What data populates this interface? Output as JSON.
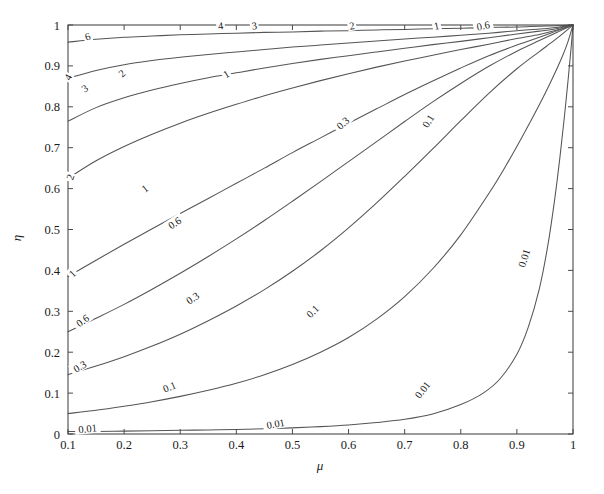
{
  "figure": {
    "kind": "contour-plot",
    "background": "#ffffff",
    "line_color": "#555555",
    "axis_color": "#4a4a4a",
    "text_color": "#1a1a1a"
  },
  "chart_data": {
    "type": "line",
    "subtype": "contour",
    "title": "",
    "xlabel": "μ",
    "ylabel": "η",
    "xlim": [
      0.1,
      1.0
    ],
    "ylim": [
      0.0,
      1.0
    ],
    "grid": false,
    "legend": "none",
    "xticks": [
      0.1,
      0.2,
      0.3,
      0.4,
      0.5,
      0.6,
      0.7,
      0.8,
      0.9,
      1.0
    ],
    "xticklabels": [
      "0.1",
      "0.2",
      "0.3",
      "0.4",
      "0.5",
      "0.6",
      "0.7",
      "0.8",
      "0.9",
      "1"
    ],
    "yticks": [
      0.0,
      0.1,
      0.2,
      0.3,
      0.4,
      0.5,
      0.6,
      0.7,
      0.8,
      0.9,
      1.0
    ],
    "yticklabels": [
      "0",
      "0.1",
      "0.2",
      "0.3",
      "0.4",
      "0.5",
      "0.6",
      "0.7",
      "0.8",
      "0.9",
      "1"
    ],
    "tick_direction": "in",
    "levels": [
      0.01,
      0.1,
      0.3,
      0.6,
      1,
      2,
      3,
      4,
      6
    ],
    "level_labels": [
      "0.01",
      "0.1",
      "0.3",
      "0.6",
      "1",
      "2",
      "3",
      "4",
      "6"
    ],
    "contours": [
      {
        "level": "0.01",
        "points": [
          [
            0.1,
            0.006
          ],
          [
            0.15,
            0.006
          ],
          [
            0.2,
            0.007
          ],
          [
            0.25,
            0.008
          ],
          [
            0.3,
            0.009
          ],
          [
            0.35,
            0.01
          ],
          [
            0.4,
            0.011
          ],
          [
            0.45,
            0.013
          ],
          [
            0.5,
            0.015
          ],
          [
            0.55,
            0.018
          ],
          [
            0.6,
            0.022
          ],
          [
            0.65,
            0.028
          ],
          [
            0.7,
            0.036
          ],
          [
            0.75,
            0.049
          ],
          [
            0.8,
            0.072
          ],
          [
            0.84,
            0.1
          ],
          [
            0.87,
            0.135
          ],
          [
            0.9,
            0.195
          ],
          [
            0.92,
            0.26
          ],
          [
            0.94,
            0.355
          ],
          [
            0.955,
            0.46
          ],
          [
            0.967,
            0.57
          ],
          [
            0.977,
            0.68
          ],
          [
            0.985,
            0.78
          ],
          [
            0.991,
            0.862
          ],
          [
            0.996,
            0.935
          ],
          [
            1.0,
            1.0
          ]
        ]
      },
      {
        "level": "0.1",
        "points": [
          [
            0.1,
            0.05
          ],
          [
            0.15,
            0.058
          ],
          [
            0.2,
            0.068
          ],
          [
            0.25,
            0.079
          ],
          [
            0.3,
            0.092
          ],
          [
            0.35,
            0.107
          ],
          [
            0.4,
            0.124
          ],
          [
            0.45,
            0.145
          ],
          [
            0.5,
            0.17
          ],
          [
            0.55,
            0.2
          ],
          [
            0.6,
            0.236
          ],
          [
            0.65,
            0.281
          ],
          [
            0.7,
            0.336
          ],
          [
            0.75,
            0.404
          ],
          [
            0.8,
            0.487
          ],
          [
            0.85,
            0.588
          ],
          [
            0.88,
            0.655
          ],
          [
            0.91,
            0.728
          ],
          [
            0.94,
            0.805
          ],
          [
            0.96,
            0.86
          ],
          [
            0.98,
            0.92
          ],
          [
            0.99,
            0.955
          ],
          [
            1.0,
            1.0
          ]
        ]
      },
      {
        "level": "0.3",
        "points": [
          [
            0.1,
            0.145
          ],
          [
            0.15,
            0.166
          ],
          [
            0.2,
            0.189
          ],
          [
            0.25,
            0.215
          ],
          [
            0.3,
            0.244
          ],
          [
            0.35,
            0.277
          ],
          [
            0.4,
            0.313
          ],
          [
            0.45,
            0.353
          ],
          [
            0.5,
            0.398
          ],
          [
            0.55,
            0.448
          ],
          [
            0.6,
            0.504
          ],
          [
            0.65,
            0.565
          ],
          [
            0.7,
            0.63
          ],
          [
            0.75,
            0.697
          ],
          [
            0.8,
            0.766
          ],
          [
            0.85,
            0.833
          ],
          [
            0.9,
            0.893
          ],
          [
            0.94,
            0.935
          ],
          [
            0.97,
            0.966
          ],
          [
            1.0,
            1.0
          ]
        ]
      },
      {
        "level": "0.6",
        "points": [
          [
            0.1,
            0.25
          ],
          [
            0.15,
            0.283
          ],
          [
            0.2,
            0.317
          ],
          [
            0.25,
            0.354
          ],
          [
            0.3,
            0.393
          ],
          [
            0.35,
            0.434
          ],
          [
            0.4,
            0.477
          ],
          [
            0.45,
            0.522
          ],
          [
            0.5,
            0.569
          ],
          [
            0.55,
            0.617
          ],
          [
            0.6,
            0.666
          ],
          [
            0.65,
            0.715
          ],
          [
            0.7,
            0.764
          ],
          [
            0.75,
            0.812
          ],
          [
            0.8,
            0.857
          ],
          [
            0.85,
            0.899
          ],
          [
            0.9,
            0.936
          ],
          [
            0.94,
            0.962
          ],
          [
            0.97,
            0.981
          ],
          [
            1.0,
            1.0
          ]
        ]
      },
      {
        "level": "1",
        "points": [
          [
            0.1,
            0.385
          ],
          [
            0.15,
            0.425
          ],
          [
            0.2,
            0.464
          ],
          [
            0.25,
            0.502
          ],
          [
            0.3,
            0.539
          ],
          [
            0.35,
            0.576
          ],
          [
            0.4,
            0.613
          ],
          [
            0.45,
            0.65
          ],
          [
            0.5,
            0.688
          ],
          [
            0.55,
            0.724
          ],
          [
            0.6,
            0.76
          ],
          [
            0.65,
            0.795
          ],
          [
            0.7,
            0.83
          ],
          [
            0.75,
            0.863
          ],
          [
            0.8,
            0.895
          ],
          [
            0.85,
            0.925
          ],
          [
            0.9,
            0.951
          ],
          [
            0.94,
            0.97
          ],
          [
            0.97,
            0.985
          ],
          [
            1.0,
            1.0
          ]
        ]
      },
      {
        "level": "2",
        "points": [
          [
            0.1,
            0.625
          ],
          [
            0.15,
            0.668
          ],
          [
            0.2,
            0.703
          ],
          [
            0.25,
            0.733
          ],
          [
            0.3,
            0.76
          ],
          [
            0.35,
            0.784
          ],
          [
            0.4,
            0.806
          ],
          [
            0.45,
            0.827
          ],
          [
            0.5,
            0.846
          ],
          [
            0.55,
            0.864
          ],
          [
            0.6,
            0.881
          ],
          [
            0.65,
            0.897
          ],
          [
            0.7,
            0.912
          ],
          [
            0.75,
            0.926
          ],
          [
            0.8,
            0.94
          ],
          [
            0.85,
            0.953
          ],
          [
            0.9,
            0.967
          ],
          [
            0.94,
            0.977
          ],
          [
            0.97,
            0.987
          ],
          [
            1.0,
            1.0
          ]
        ]
      },
      {
        "level": "3",
        "points": [
          [
            0.1,
            0.765
          ],
          [
            0.15,
            0.798
          ],
          [
            0.2,
            0.822
          ],
          [
            0.25,
            0.841
          ],
          [
            0.3,
            0.857
          ],
          [
            0.35,
            0.871
          ],
          [
            0.4,
            0.883
          ],
          [
            0.45,
            0.895
          ],
          [
            0.5,
            0.906
          ],
          [
            0.55,
            0.916
          ],
          [
            0.6,
            0.925
          ],
          [
            0.65,
            0.934
          ],
          [
            0.7,
            0.943
          ],
          [
            0.75,
            0.952
          ],
          [
            0.8,
            0.96
          ],
          [
            0.85,
            0.969
          ],
          [
            0.9,
            0.978
          ],
          [
            0.94,
            0.985
          ],
          [
            0.97,
            0.991
          ],
          [
            1.0,
            1.0
          ]
        ]
      },
      {
        "level": "4",
        "points": [
          [
            0.1,
            0.87
          ],
          [
            0.15,
            0.889
          ],
          [
            0.2,
            0.903
          ],
          [
            0.25,
            0.913
          ],
          [
            0.3,
            0.921
          ],
          [
            0.35,
            0.928
          ],
          [
            0.4,
            0.934
          ],
          [
            0.45,
            0.94
          ],
          [
            0.5,
            0.946
          ],
          [
            0.55,
            0.951
          ],
          [
            0.6,
            0.956
          ],
          [
            0.65,
            0.961
          ],
          [
            0.7,
            0.966
          ],
          [
            0.75,
            0.97
          ],
          [
            0.8,
            0.975
          ],
          [
            0.85,
            0.98
          ],
          [
            0.9,
            0.986
          ],
          [
            0.94,
            0.99
          ],
          [
            0.97,
            0.994
          ],
          [
            1.0,
            1.0
          ]
        ]
      },
      {
        "level": "6",
        "points": [
          [
            0.1,
            0.958
          ],
          [
            0.15,
            0.965
          ],
          [
            0.2,
            0.97
          ],
          [
            0.25,
            0.973
          ],
          [
            0.3,
            0.976
          ],
          [
            0.35,
            0.978
          ],
          [
            0.4,
            0.98
          ],
          [
            0.45,
            0.982
          ],
          [
            0.5,
            0.983
          ],
          [
            0.55,
            0.985
          ],
          [
            0.6,
            0.986
          ],
          [
            0.65,
            0.988
          ],
          [
            0.7,
            0.989
          ],
          [
            0.75,
            0.991
          ],
          [
            0.8,
            0.992
          ],
          [
            0.85,
            0.994
          ],
          [
            0.9,
            0.995
          ],
          [
            0.94,
            0.997
          ],
          [
            0.97,
            0.998
          ],
          [
            1.0,
            1.0
          ]
        ]
      }
    ],
    "inline_labels": [
      {
        "text": "6",
        "x": 0.135,
        "y": 0.972,
        "rotation": -18
      },
      {
        "text": "4",
        "x": 0.1,
        "y": 0.872,
        "rotation": -62
      },
      {
        "text": "4",
        "x": 0.372,
        "y": 0.998,
        "rotation": -8
      },
      {
        "text": "3",
        "x": 0.13,
        "y": 0.845,
        "rotation": -36
      },
      {
        "text": "3",
        "x": 0.432,
        "y": 0.998,
        "rotation": -8
      },
      {
        "text": "2",
        "x": 0.104,
        "y": 0.628,
        "rotation": -70
      },
      {
        "text": "2",
        "x": 0.196,
        "y": 0.882,
        "rotation": -40
      },
      {
        "text": "2",
        "x": 0.606,
        "y": 0.998,
        "rotation": -10
      },
      {
        "text": "1",
        "x": 0.108,
        "y": 0.392,
        "rotation": -44
      },
      {
        "text": "1",
        "x": 0.237,
        "y": 0.6,
        "rotation": -38
      },
      {
        "text": "1",
        "x": 0.382,
        "y": 0.88,
        "rotation": -30
      },
      {
        "text": "1",
        "x": 0.757,
        "y": 0.998,
        "rotation": -12
      },
      {
        "text": "0.6",
        "x": 0.126,
        "y": 0.277,
        "rotation": -36
      },
      {
        "text": "0.6",
        "x": 0.29,
        "y": 0.516,
        "rotation": -34
      },
      {
        "text": "0.6",
        "x": 0.84,
        "y": 0.998,
        "rotation": -12
      },
      {
        "text": "0.3",
        "x": 0.121,
        "y": 0.165,
        "rotation": -30
      },
      {
        "text": "0.3",
        "x": 0.322,
        "y": 0.332,
        "rotation": -34
      },
      {
        "text": "0.3",
        "x": 0.59,
        "y": 0.76,
        "rotation": -42
      },
      {
        "text": "0.1",
        "x": 0.281,
        "y": 0.115,
        "rotation": -22
      },
      {
        "text": "0.1",
        "x": 0.536,
        "y": 0.3,
        "rotation": -44
      },
      {
        "text": "0.1",
        "x": 0.742,
        "y": 0.765,
        "rotation": -58
      },
      {
        "text": "0.01",
        "x": 0.135,
        "y": 0.013,
        "rotation": -6
      },
      {
        "text": "0.01",
        "x": 0.47,
        "y": 0.025,
        "rotation": -10
      },
      {
        "text": "0.01",
        "x": 0.732,
        "y": 0.108,
        "rotation": -52
      },
      {
        "text": "0.01",
        "x": 0.913,
        "y": 0.43,
        "rotation": -72
      }
    ]
  }
}
